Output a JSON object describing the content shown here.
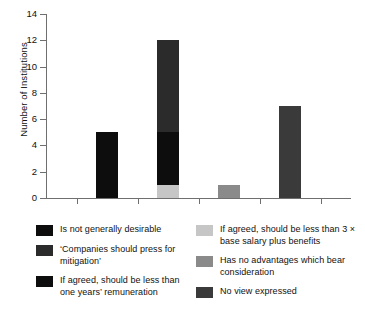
{
  "chart_data": {
    "type": "bar",
    "subtype": "stacked-bar",
    "title": "",
    "xlabel": "",
    "ylabel": "Number of Institutions",
    "ylim": [
      0,
      14
    ],
    "ytick_labels": [
      "0",
      "2",
      "4",
      "6",
      "8",
      "10",
      "12",
      "14"
    ],
    "ytick_values": [
      0,
      2,
      4,
      6,
      8,
      10,
      12,
      14
    ],
    "ystep": 2,
    "grid": false,
    "legend_position": "below",
    "categories": [
      "",
      "",
      "",
      ""
    ],
    "xtick_labels": [],
    "series": [
      {
        "name": "Is not generally desirable",
        "color": "#0d0d0d",
        "values": [
          5,
          0,
          0,
          0
        ]
      },
      {
        "name": "If agreed, should be less than 3 × base salary plus benefits",
        "color": "#c6c6c6",
        "values": [
          0,
          1,
          0,
          0
        ]
      },
      {
        "name": "If agreed, should be less than one years’ remuneration",
        "color": "#0d0d0d",
        "values": [
          0,
          4,
          0,
          0
        ]
      },
      {
        "name": "‘Companies should press for mitigation’",
        "color": "#2b2b2b",
        "values": [
          0,
          7,
          0,
          0
        ]
      },
      {
        "name": "Has no advantages which bear consideration",
        "color": "#8a8a8a",
        "values": [
          0,
          0,
          1,
          0
        ]
      },
      {
        "name": "No view expressed",
        "color": "#3a3a3a",
        "values": [
          0,
          0,
          0,
          7
        ]
      }
    ],
    "bar_totals": [
      5,
      12,
      1,
      7
    ],
    "bars": [
      {
        "index": 0,
        "total": 5,
        "segments": [
          {
            "label": "Is not generally desirable",
            "value": 5,
            "from": 0,
            "to": 5,
            "color": "#0d0d0d"
          }
        ]
      },
      {
        "index": 1,
        "total": 12,
        "segments": [
          {
            "label": "If agreed, should be less than 3 × base salary plus benefits",
            "value": 1,
            "from": 0,
            "to": 1,
            "color": "#c6c6c6"
          },
          {
            "label": "If agreed, should be less than one years’ remuneration",
            "value": 4,
            "from": 1,
            "to": 5,
            "color": "#0d0d0d"
          },
          {
            "label": "‘Companies should press for mitigation’",
            "value": 7,
            "from": 5,
            "to": 12,
            "color": "#2b2b2b"
          }
        ]
      },
      {
        "index": 2,
        "total": 1,
        "segments": [
          {
            "label": "Has no advantages which bear consideration",
            "value": 1,
            "from": 0,
            "to": 1,
            "color": "#8a8a8a"
          }
        ]
      },
      {
        "index": 3,
        "total": 7,
        "segments": [
          {
            "label": "No view expressed",
            "value": 7,
            "from": 0,
            "to": 7,
            "color": "#3a3a3a"
          }
        ]
      }
    ]
  },
  "axis": {
    "ylabel": "Number of Institutions",
    "ticks": [
      {
        "label": "14",
        "value": 14
      },
      {
        "label": "12",
        "value": 12
      },
      {
        "label": "10",
        "value": 10
      },
      {
        "label": "8",
        "value": 8
      },
      {
        "label": "6",
        "value": 6
      },
      {
        "label": "4",
        "value": 4
      },
      {
        "label": "2",
        "value": 2
      },
      {
        "label": "0",
        "value": 0
      }
    ]
  },
  "legend": {
    "left_column": [
      {
        "label": "Is not generally desirable",
        "color": "#0d0d0d"
      },
      {
        "label": "‘Companies should press for mitigation’",
        "color": "#2b2b2b"
      },
      {
        "label": "If agreed, should be less than one years’ remuneration",
        "color": "#0d0d0d"
      }
    ],
    "right_column": [
      {
        "label": "If agreed, should be less than 3 × base salary plus benefits",
        "color": "#c6c6c6"
      },
      {
        "label": "Has no advantages which bear consideration",
        "color": "#8a8a8a"
      },
      {
        "label": "No view expressed",
        "color": "#3a3a3a"
      }
    ]
  }
}
